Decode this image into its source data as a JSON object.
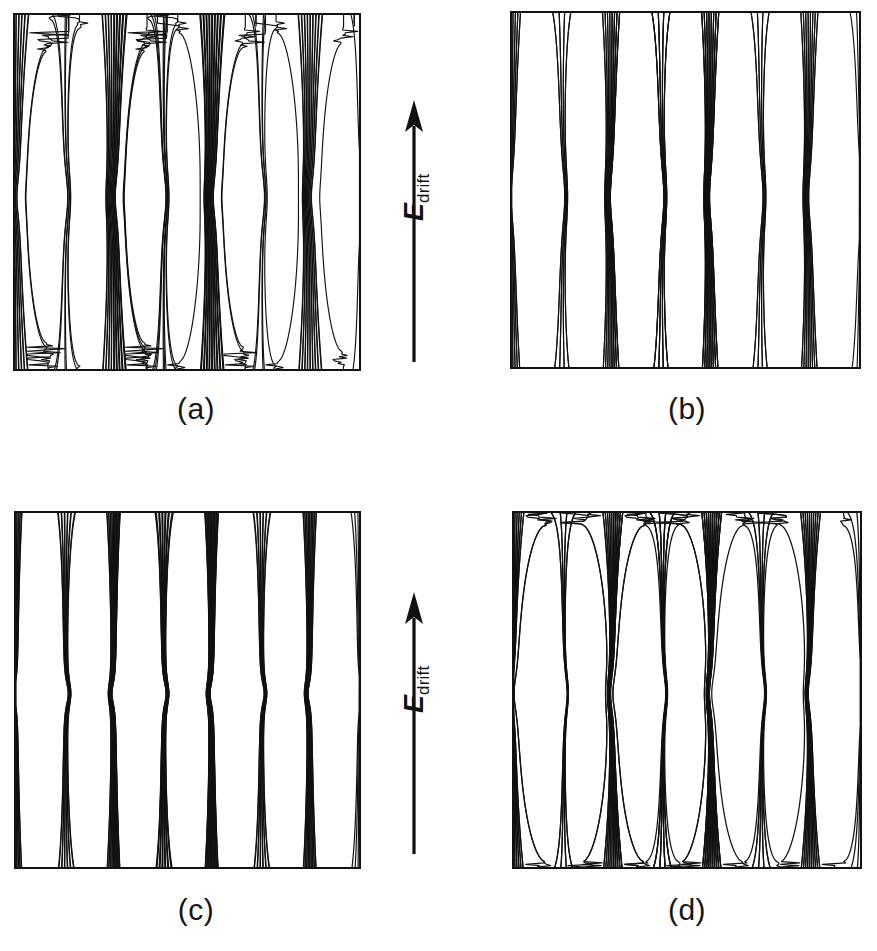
{
  "figure": {
    "kind": "four-panel-field-line-diagram",
    "background_color": "#ffffff",
    "line_color": "#111111",
    "panels": [
      {
        "id": "a",
        "caption": "(a)"
      },
      {
        "id": "b",
        "caption": "(b)"
      },
      {
        "id": "c",
        "caption": "(c)"
      },
      {
        "id": "d",
        "caption": "(d)"
      }
    ],
    "annotations": {
      "drift_symbol": "E",
      "drift_subscript": "drift",
      "arrow_direction": "up",
      "arrow_count": 2
    }
  },
  "chart_data": {
    "type": "line",
    "title": "",
    "subtitle": "",
    "xlabel": "",
    "ylabel": "",
    "legend": [],
    "grid": false,
    "panels": [
      {
        "id": "a",
        "caption": "(a)",
        "amplitude": 0.22,
        "n_lines": 46,
        "periods": 3.5,
        "null_rows": [
          0.42,
          0.55
        ],
        "cusp_sharpness": 0.9,
        "band_thickness": "thin",
        "xlim": [
          0,
          1
        ],
        "ylim": [
          0,
          1
        ]
      },
      {
        "id": "b",
        "caption": "(b)",
        "amplitude": 0.34,
        "n_lines": 42,
        "periods": 3.5,
        "null_rows": [
          0.4,
          0.56
        ],
        "cusp_sharpness": 1.0,
        "band_thickness": "thin",
        "xlim": [
          0,
          1
        ],
        "ylim": [
          0,
          1
        ]
      },
      {
        "id": "c",
        "caption": "(c)",
        "amplitude": 0.48,
        "n_lines": 52,
        "periods": 3.5,
        "null_rows": [
          0.46,
          0.52
        ],
        "cusp_sharpness": 1.6,
        "band_thickness": "dense",
        "xlim": [
          0,
          1
        ],
        "ylim": [
          0,
          1
        ]
      },
      {
        "id": "d",
        "caption": "(d)",
        "amplitude": 0.62,
        "n_lines": 56,
        "periods": 3.5,
        "null_rows": [
          0.44,
          0.54
        ],
        "cusp_sharpness": 2.2,
        "band_thickness": "very-dense",
        "xlim": [
          0,
          1
        ],
        "ylim": [
          0,
          1
        ]
      }
    ]
  }
}
